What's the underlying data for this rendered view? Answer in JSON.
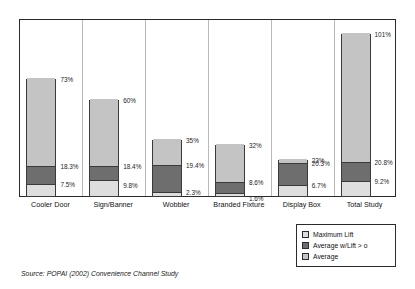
{
  "chart_data": {
    "type": "bar",
    "title": "",
    "subtitle": "",
    "xlabel": "",
    "ylabel": "",
    "ylim": [
      0,
      110
    ],
    "grid": false,
    "legend_position": "bottom-right",
    "stacked_cumulative": true,
    "categories": [
      "Cooler Door",
      "Sign/Banner",
      "Wobbler",
      "Branded Fixture",
      "Display Box",
      "Total Study"
    ],
    "series": [
      {
        "name": "Maximum Lift",
        "values": [
          73,
          60,
          35,
          32,
          23,
          101
        ],
        "labels": [
          "73%",
          "60%",
          "35%",
          "32%",
          "23%",
          "101%"
        ],
        "color": "#c4c4c4"
      },
      {
        "name": "Average w/Lift > o",
        "values": [
          18.3,
          18.4,
          19.4,
          8.6,
          20.3,
          20.8
        ],
        "labels": [
          "18.3%",
          "18.4%",
          "19.4%",
          "8.6%",
          "20.3%",
          "20.8%"
        ],
        "color": "#6e6e6e"
      },
      {
        "name": "Average",
        "values": [
          7.5,
          9.8,
          2.3,
          1.6,
          6.7,
          9.2
        ],
        "labels": [
          "7.5%",
          "9.8%",
          "2.3%",
          "1.6%",
          "6.7%",
          "9.2%"
        ],
        "color": "#dedede"
      }
    ]
  },
  "legend": {
    "items": [
      {
        "label": "Maximum Lift"
      },
      {
        "label": "Average w/Lift > o"
      },
      {
        "label": "Average"
      }
    ]
  },
  "source": {
    "text": "Source:  POPAI (2002) Convenience Channel Study"
  }
}
